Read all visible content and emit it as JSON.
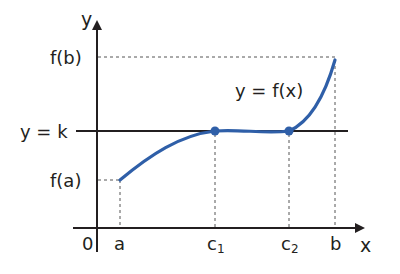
{
  "axes": {
    "x_label": "x",
    "y_label": "y",
    "origin_label": "0"
  },
  "y_ticks": {
    "fb": "f(b)",
    "k": "y = k",
    "fa": "f(a)"
  },
  "x_ticks": {
    "a": "a",
    "c1": "c",
    "c1_sub": "1",
    "c2": "c",
    "c2_sub": "2",
    "b": "b"
  },
  "curve_label": "y = f(x)",
  "colors": {
    "curve": "#2f5fa8",
    "axis": "#231f20",
    "dashed": "#555555"
  }
}
